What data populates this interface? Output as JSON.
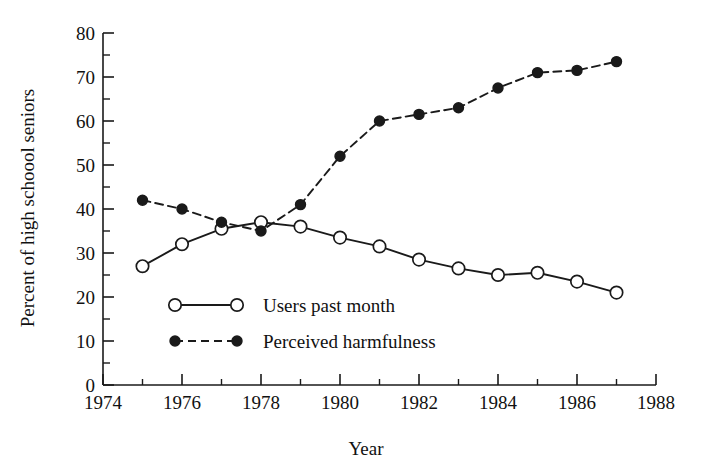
{
  "chart_data": {
    "type": "line",
    "title": "",
    "xlabel": "Year",
    "ylabel": "Percent of high schoool seniors",
    "xlim": [
      1974,
      1988
    ],
    "ylim": [
      0,
      80
    ],
    "xticks": [
      1974,
      1976,
      1978,
      1980,
      1982,
      1984,
      1986,
      1988
    ],
    "xtick_labels": [
      "1974",
      "1976",
      "1978",
      "1980",
      "1982",
      "1984",
      "1986",
      "1988"
    ],
    "x_minor_tick_step": 1,
    "yticks": [
      0,
      10,
      20,
      30,
      40,
      50,
      60,
      70,
      80
    ],
    "ytick_labels": [
      "0",
      "10",
      "20",
      "30",
      "40",
      "50",
      "60",
      "70",
      "80"
    ],
    "y_minor_tick_step": 5,
    "grid": false,
    "legend_position": "inside lower-left",
    "x": [
      1975,
      1976,
      1977,
      1978,
      1979,
      1980,
      1981,
      1982,
      1983,
      1984,
      1985,
      1986,
      1987
    ],
    "series": [
      {
        "name": "Users past month",
        "marker": "open-circle",
        "linestyle": "solid",
        "color": "#1a1a1a",
        "values": [
          27,
          32,
          35.5,
          37,
          36,
          33.5,
          31.5,
          28.5,
          26.5,
          25,
          25.5,
          23.5,
          21
        ]
      },
      {
        "name": "Perceived harmfulness",
        "marker": "filled-circle",
        "linestyle": "dashed",
        "color": "#1a1a1a",
        "values": [
          42,
          40,
          37,
          35,
          41,
          52,
          60,
          61.5,
          63,
          67.5,
          71,
          71.5,
          73.5
        ]
      }
    ]
  },
  "axes": {
    "y_title": "Percent of high schoool seniors",
    "x_title": "Year"
  },
  "legend": {
    "items": [
      {
        "label": "Users past month",
        "marker": "open-circle",
        "linestyle": "solid"
      },
      {
        "label": "Perceived harmfulness",
        "marker": "filled-circle",
        "linestyle": "dashed"
      }
    ]
  }
}
